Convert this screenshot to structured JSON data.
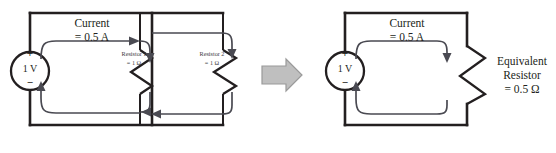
{
  "diagram": {
    "background_color": "#ffffff",
    "wire_color": "#231f20",
    "current_arrow_color": "#4a4a52",
    "transition_arrow_color": "#bfbfbf"
  },
  "left_circuit": {
    "name": "Two parallel resistors circuit",
    "source": {
      "value_label": "1 V",
      "plus_sign": "+",
      "minus_sign": "−"
    },
    "current": {
      "line1": "Current",
      "line2": "= 0.5 A"
    },
    "resistor1": {
      "line1": "Resistor 1",
      "line2": "= 1 Ω"
    },
    "resistor2": {
      "line1": "Resistor 2",
      "line2": "= 1 Ω"
    }
  },
  "transition": {
    "icon": "right-arrow-icon",
    "label": ""
  },
  "right_circuit": {
    "name": "Equivalent resistor circuit",
    "source": {
      "value_label": "1 V",
      "plus_sign": "+",
      "minus_sign": "−"
    },
    "current": {
      "line1": "Current",
      "line2": "= 0.5 A"
    },
    "equivalent_resistor": {
      "line1": "Equivalent",
      "line2": "Resistor",
      "line3": "= 0.5 Ω"
    }
  }
}
